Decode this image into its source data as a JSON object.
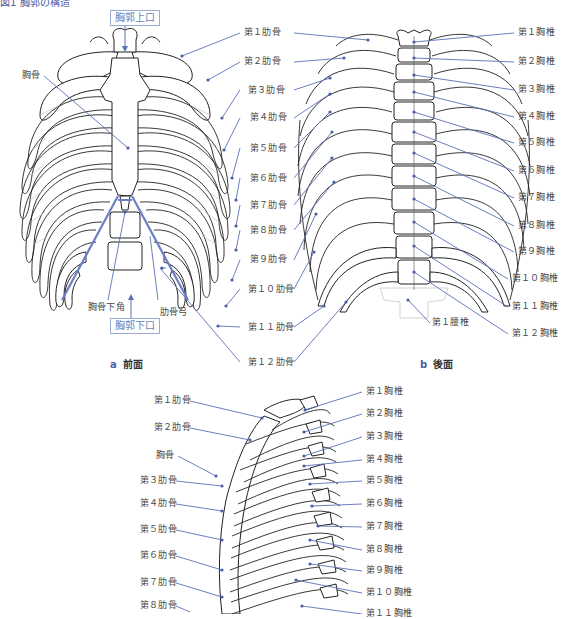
{
  "figure": {
    "title_partial": "図1 胸郭の構造",
    "accent_color": "#5a70b8",
    "line_color": "#2a2a2a"
  },
  "panel_a": {
    "caption_letter": "a",
    "caption_text": "前面",
    "box_labels": {
      "upper": "胸郭上口",
      "lower": "胸郭下口"
    },
    "left_labels": {
      "sternum": "胸骨",
      "infrasternal_angle": "胸骨下角",
      "costal_arch": "肋骨弓"
    },
    "ribs": [
      "第１肋骨",
      "第２肋骨",
      "第３肋骨",
      "第４肋骨",
      "第５肋骨",
      "第６肋骨",
      "第７肋骨",
      "第８肋骨",
      "第９肋骨",
      "第１０肋骨",
      "第１１肋骨",
      "第１２肋骨"
    ]
  },
  "panel_b": {
    "caption_letter": "b",
    "caption_text": "後面",
    "vertebrae": [
      "第１胸椎",
      "第２胸椎",
      "第３胸椎",
      "第４胸椎",
      "第５胸椎",
      "第６胸椎",
      "第７胸椎",
      "第８胸椎",
      "第９胸椎",
      "第１０胸椎",
      "第１１胸椎",
      "第１２胸椎"
    ],
    "lumbar": "第１腰椎"
  },
  "panel_c": {
    "left_labels": [
      "第１肋骨",
      "第２肋骨",
      "胸骨",
      "第３肋骨",
      "第４肋骨",
      "第５肋骨",
      "第６肋骨",
      "第７肋骨",
      "第８肋骨"
    ],
    "right_labels": [
      "第１胸椎",
      "第２胸椎",
      "第３胸椎",
      "第４胸椎",
      "第５胸椎",
      "第６胸椎",
      "第７胸椎",
      "第８胸椎",
      "第９胸椎",
      "第１０胸椎",
      "第１１胸椎"
    ]
  }
}
